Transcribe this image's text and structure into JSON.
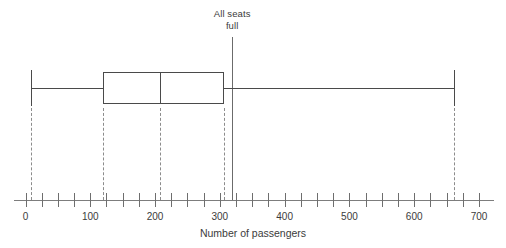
{
  "chart_data": {
    "type": "boxplot",
    "title": "",
    "xlabel": "Number of passengers",
    "ylabel": "",
    "xlim": [
      0,
      700
    ],
    "grid": false,
    "legend": null,
    "tick_step": 25,
    "label_step": 100,
    "tick_labels": [
      "0",
      "100",
      "200",
      "300",
      "400",
      "500",
      "600",
      "700"
    ],
    "tick_values": [
      0,
      100,
      200,
      300,
      400,
      500,
      600,
      700
    ],
    "minor_tick_values": [
      0,
      25,
      50,
      75,
      100,
      125,
      150,
      175,
      200,
      225,
      250,
      275,
      300,
      325,
      350,
      375,
      400,
      425,
      450,
      475,
      500,
      525,
      550,
      575,
      600,
      625,
      650,
      675,
      700
    ],
    "box": {
      "min": 8,
      "q1": 120,
      "median": 208,
      "q3": 307,
      "max": 662,
      "droplines": [
        8,
        120,
        208,
        307,
        662
      ]
    },
    "annotations": [
      {
        "name": "all-seats-full",
        "label_line1": "All seats",
        "label_line2": "full",
        "value": 319,
        "style": "vertical-reference-line"
      }
    ],
    "colors": {
      "box_stroke": "#4a4a4a",
      "whisker": "#4a4a4a",
      "dropline": "#8c8c8c",
      "axis": "#7d7d7d",
      "tick": "#6e6e6e",
      "reference_line": "#6b6b6b",
      "text": "#3b3b3b",
      "background": "#ffffff"
    }
  }
}
